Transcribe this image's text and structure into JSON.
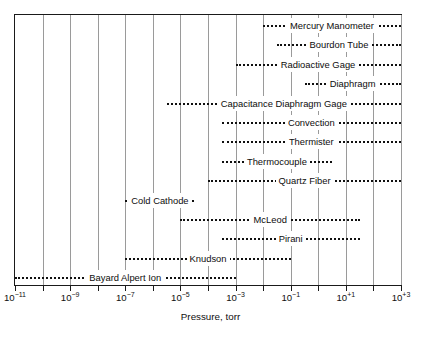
{
  "chart_data": {
    "type": "table",
    "title": "",
    "xlabel": "Pressure, torr",
    "ylabel": "",
    "xscale": "log",
    "xlim": [
      -11,
      3
    ],
    "grid": true,
    "grid_decades": [
      -11,
      -10,
      -9,
      -8,
      -7,
      -6,
      -5,
      -4,
      -3,
      -2,
      -1,
      0,
      1,
      2,
      3
    ],
    "xticks": [
      -11,
      -9,
      -7,
      -5,
      -3,
      -1,
      1,
      3
    ],
    "xtick_labels": [
      "10−11",
      "10−9",
      "10−7",
      "10−5",
      "10−3",
      "10−1",
      "10+1",
      "10+3"
    ],
    "legend": "none",
    "note": "Horizontal dotted bars show the operating pressure range of each gauge; label text is centered inside each bar.",
    "rows": [
      {
        "label": "Mercury Manometer",
        "min_exp": -2.0,
        "max_exp": 3.0
      },
      {
        "label": "Bourdon Tube",
        "min_exp": -1.5,
        "max_exp": 3.0
      },
      {
        "label": "Radioactive Gage",
        "min_exp": -3.0,
        "max_exp": 3.0
      },
      {
        "label": "Diaphragm",
        "min_exp": -0.5,
        "max_exp": 3.0
      },
      {
        "label": "Capacitance Diaphragm Gage",
        "min_exp": -5.5,
        "max_exp": 3.0
      },
      {
        "label": "Convection",
        "min_exp": -3.5,
        "max_exp": 3.0
      },
      {
        "label": "Thermister",
        "min_exp": -3.5,
        "max_exp": 3.0
      },
      {
        "label": "Thermocouple",
        "min_exp": -3.5,
        "max_exp": 0.5
      },
      {
        "label": "Quartz Fiber",
        "min_exp": -4.0,
        "max_exp": 3.0
      },
      {
        "label": "Cold Cathode",
        "min_exp": -7.0,
        "max_exp": -4.5
      },
      {
        "label": "McLeod",
        "min_exp": -5.0,
        "max_exp": 1.5
      },
      {
        "label": "Pirani",
        "min_exp": -3.5,
        "max_exp": 1.5
      },
      {
        "label": "Knudson",
        "min_exp": -7.0,
        "max_exp": -1.0
      },
      {
        "label": "Bayard Alpert Ion",
        "min_exp": -11.0,
        "max_exp": -3.0
      }
    ]
  },
  "axis": {
    "xlabel": "Pressure, torr",
    "ticks": [
      {
        "exp": -11,
        "mantissa": "10",
        "sup": "−11"
      },
      {
        "exp": -9,
        "mantissa": "10",
        "sup": "−9"
      },
      {
        "exp": -7,
        "mantissa": "10",
        "sup": "−7"
      },
      {
        "exp": -5,
        "mantissa": "10",
        "sup": "−5"
      },
      {
        "exp": -3,
        "mantissa": "10",
        "sup": "−3"
      },
      {
        "exp": -1,
        "mantissa": "10",
        "sup": "−1"
      },
      {
        "exp": 1,
        "mantissa": "10",
        "sup": "+1"
      },
      {
        "exp": 3,
        "mantissa": "10",
        "sup": "+3"
      }
    ]
  },
  "colors": {
    "frame": "#1a1a1a",
    "grid": "#9a9a9a",
    "dots": "#101010",
    "text": "#0d0d0d",
    "background": "#ffffff"
  }
}
